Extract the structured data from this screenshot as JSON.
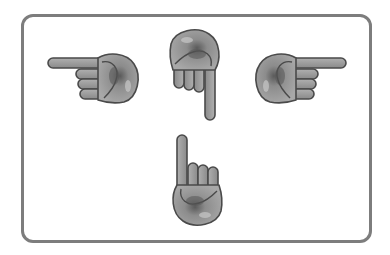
{
  "figure": {
    "frame_color": "#7d7d7d",
    "hand_fill": "#9a9a9a",
    "hand_outline": "#4a4a4a",
    "hands": [
      {
        "direction": "left",
        "icon": "hand-pointing-left-icon"
      },
      {
        "direction": "up",
        "icon": "hand-pointing-up-icon"
      },
      {
        "direction": "right",
        "icon": "hand-pointing-right-icon"
      },
      {
        "direction": "down",
        "icon": "hand-pointing-down-icon"
      }
    ]
  }
}
